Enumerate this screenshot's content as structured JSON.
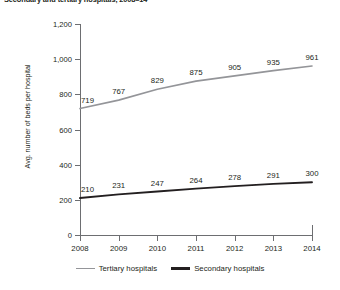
{
  "chart_data": {
    "type": "line",
    "title": "Secondary and tertiary hospitals, 2008–14",
    "xlabel": "",
    "ylabel": "Avg. number of beds per hospital",
    "categories": [
      "2008",
      "2009",
      "2010",
      "2011",
      "2012",
      "2013",
      "2014"
    ],
    "x": [
      2008,
      2009,
      2010,
      2011,
      2012,
      2013,
      2014
    ],
    "series": [
      {
        "name": "Tertiary hospitals",
        "color": "#949599",
        "values": [
          719,
          767,
          829,
          875,
          905,
          935,
          961
        ]
      },
      {
        "name": "Secondary hospitals",
        "color": "#231f20",
        "values": [
          210,
          231,
          247,
          264,
          278,
          291,
          300
        ]
      }
    ],
    "ylim": [
      0,
      1200
    ],
    "yticks": [
      0,
      200,
      400,
      600,
      800,
      1000,
      1200
    ],
    "ytick_labels": [
      "0",
      "200",
      "400",
      "600",
      "800",
      "1,000",
      "1,200"
    ],
    "xlim": [
      2008,
      2014
    ],
    "grid": false,
    "legend_position": "bottom",
    "data_labels": true
  },
  "axis": {
    "y_title": "Avg. number of beds per hospital",
    "y_tick_labels": [
      "1,200",
      "1,000",
      "800",
      "600",
      "400",
      "200",
      "0"
    ],
    "x_tick_labels": [
      "2008",
      "2009",
      "2010",
      "2011",
      "2012",
      "2013",
      "2014"
    ]
  },
  "legend": {
    "items": [
      {
        "label": "Tertiary hospitals",
        "color": "#949599"
      },
      {
        "label": "Secondary hospitals",
        "color": "#231f20"
      }
    ]
  },
  "labels": {
    "tertiary": [
      "719",
      "767",
      "829",
      "875",
      "905",
      "935",
      "961"
    ],
    "secondary": [
      "210",
      "231",
      "247",
      "264",
      "278",
      "291",
      "300"
    ]
  },
  "colors": {
    "tertiary_line": "#949599",
    "secondary_line": "#231f20",
    "axis": "#6d6e71",
    "text": "#231f20",
    "background": "#ffffff"
  }
}
